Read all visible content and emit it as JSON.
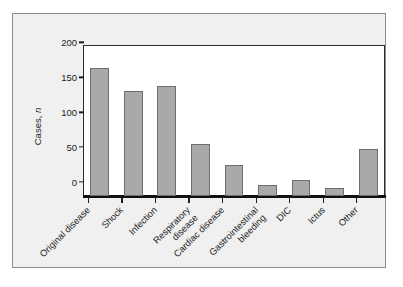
{
  "chart_data": {
    "type": "bar",
    "title": "",
    "subtitle": "",
    "xlabel": "",
    "ylabel": "Cases, n",
    "ylabel_plain": "Cases,",
    "ylabel_italic": "n",
    "categories": [
      "Original disease",
      "Shock",
      "Infection",
      "Respiratory\ndisease",
      "Cardiac disease",
      "Gastrointestinal\nbleeding",
      "DIC",
      "Ictus",
      "Other"
    ],
    "values": [
      184,
      150,
      157,
      74,
      44,
      16,
      23,
      11,
      67
    ],
    "ylim": [
      0,
      215
    ],
    "yticks": [
      0,
      50,
      100,
      150,
      200
    ],
    "ytick_labels": [
      "0",
      "50",
      "100",
      "150",
      "200"
    ],
    "grid": false,
    "legend": "none",
    "bar_color": "#a9a9a9",
    "bar_edge_color": "#6d6d6d",
    "axis_color": "#1d1d1d",
    "panel_background": "#f0f0f0",
    "plot_background": "#ffffff"
  }
}
